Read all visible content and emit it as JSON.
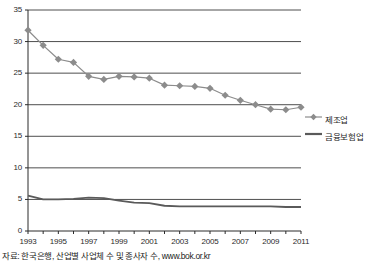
{
  "chart_data": {
    "type": "line",
    "title": "",
    "xlabel": "",
    "ylabel": "",
    "xlim": [
      1993,
      2011
    ],
    "ylim": [
      0,
      35
    ],
    "ytick_values": [
      0,
      5,
      10,
      15,
      20,
      25,
      30,
      35
    ],
    "ytick_labels": [
      "0",
      "5",
      "10",
      "15",
      "20",
      "25",
      "30",
      "35"
    ],
    "x": [
      1993,
      1994,
      1995,
      1996,
      1997,
      1998,
      1999,
      2000,
      2001,
      2002,
      2003,
      2004,
      2005,
      2006,
      2007,
      2008,
      2009,
      2010,
      2011
    ],
    "xtick_labels": [
      "1993",
      "",
      "1995",
      "",
      "1997",
      "",
      "1999",
      "",
      "2001",
      "",
      "2003",
      "",
      "2005",
      "",
      "2007",
      "",
      "2009",
      "",
      "2011"
    ],
    "xtick_labels_shown": [
      "1993",
      "1995",
      "1997",
      "1999",
      "2001",
      "2003",
      "2005",
      "2007",
      "2009",
      "2011"
    ],
    "grid": "horizontal",
    "legend_position": "right",
    "series": [
      {
        "name": "제조업",
        "marker": "diamond",
        "color": "#8c8c8c",
        "values": [
          31.8,
          29.4,
          27.2,
          26.7,
          24.5,
          24.0,
          24.5,
          24.4,
          24.2,
          23.1,
          23.0,
          22.9,
          22.6,
          21.5,
          20.7,
          20.0,
          19.3,
          19.2,
          19.6
        ]
      },
      {
        "name": "금융보험업",
        "marker": "none",
        "color": "#5a5a5a",
        "values": [
          5.6,
          5.0,
          5.0,
          5.1,
          5.3,
          5.2,
          4.8,
          4.5,
          4.4,
          4.0,
          3.9,
          3.9,
          3.9,
          3.9,
          3.9,
          3.9,
          3.9,
          3.8,
          3.8
        ]
      }
    ]
  },
  "legend": {
    "items": [
      {
        "label": "제조업",
        "marker": "diamond-line",
        "color": "#8c8c8c"
      },
      {
        "label": "금융보험업",
        "marker": "line",
        "color": "#5a5a5a"
      }
    ]
  },
  "source": {
    "text": "자료: 한국은행, 산업별 사업체 수 및 종사자 수, www.bok.or.kr"
  },
  "colors": {
    "series1": "#8c8c8c",
    "series2": "#5a5a5a",
    "grid": "#3a3a3a",
    "axis": "#2b2b2b",
    "text": "#1e1e1e",
    "background": "#ffffff"
  }
}
